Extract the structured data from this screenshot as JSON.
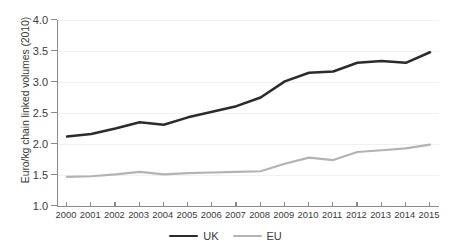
{
  "chart_data": {
    "type": "line",
    "title": "",
    "xlabel": "",
    "ylabel": "Euro/kg chain linked volumes (2010)",
    "categories": [
      "2000",
      "2001",
      "2002",
      "2003",
      "2004",
      "2005",
      "2006",
      "2007",
      "2008",
      "2009",
      "2010",
      "2011",
      "2012",
      "2013",
      "2014",
      "2015"
    ],
    "x": [
      2000,
      2001,
      2002,
      2003,
      2004,
      2005,
      2006,
      2007,
      2008,
      2009,
      2010,
      2011,
      2012,
      2013,
      2014,
      2015
    ],
    "ylim": [
      1.0,
      4.0
    ],
    "ytick_labels": [
      "1.0",
      "1.5",
      "2.0",
      "2.5",
      "3.0",
      "3.5",
      "4.0"
    ],
    "ytick_values": [
      1.0,
      1.5,
      2.0,
      2.5,
      3.0,
      3.5,
      4.0
    ],
    "grid": true,
    "grid_axis": "y",
    "legend_position": "bottom-center",
    "series": [
      {
        "name": "UK",
        "color": "#2b2b2b",
        "values": [
          2.12,
          2.16,
          2.25,
          2.35,
          2.31,
          2.43,
          2.52,
          2.61,
          2.75,
          3.01,
          3.15,
          3.17,
          3.31,
          3.34,
          3.31,
          3.48
        ]
      },
      {
        "name": "EU",
        "color": "#b3b3b3",
        "values": [
          1.47,
          1.48,
          1.51,
          1.55,
          1.51,
          1.53,
          1.54,
          1.55,
          1.56,
          1.68,
          1.78,
          1.74,
          1.87,
          1.9,
          1.93,
          1.99
        ]
      }
    ]
  },
  "legend": {
    "items": [
      {
        "label": "UK",
        "color": "#2b2b2b"
      },
      {
        "label": "EU",
        "color": "#b3b3b3"
      }
    ]
  },
  "axes": {
    "y_title": "Euro/kg chain linked volumes (2010)"
  },
  "colors": {
    "uk_line": "#2b2b2b",
    "eu_line": "#b3b3b3",
    "axis": "#8a8a8a",
    "gridline": "#f0f1f3",
    "text": "#3a3a3a",
    "background": "#ffffff"
  }
}
